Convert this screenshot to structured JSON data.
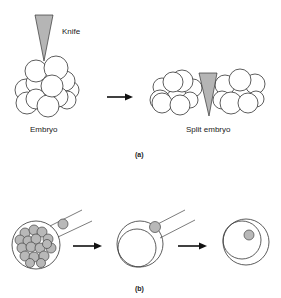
{
  "figure": {
    "panel_a": {
      "label": "(a)",
      "knife_label": "Knife",
      "embryo_label": "Embryo",
      "split_label": "Split embryo"
    },
    "panel_b": {
      "label": "(b)"
    },
    "colors": {
      "knife_fill": "#b5b5b5",
      "cell_fill": "#ffffff",
      "gray_cell_fill": "#b8b8b8",
      "stroke": "#333333"
    }
  }
}
